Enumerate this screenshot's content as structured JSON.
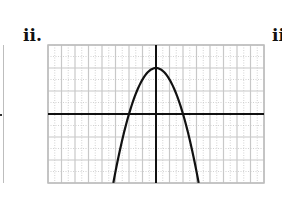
{
  "labels": {
    "main": "ii.",
    "next": "ii"
  },
  "colors": {
    "grid": "#c8c8c8",
    "axis": "#111111",
    "curve": "#111111",
    "frame": "#bcbcbc"
  },
  "chart_data": {
    "type": "line",
    "title": "ii.",
    "function": "y = 4 - x^2",
    "vertex": [
      0,
      4
    ],
    "x_intercepts": [
      -2,
      2
    ],
    "x": [
      -3.16,
      -3,
      -2.5,
      -2,
      -1.5,
      -1,
      -0.5,
      0,
      0.5,
      1,
      1.5,
      2,
      2.5,
      3,
      3.16
    ],
    "values": [
      -6,
      -5,
      -2.25,
      0,
      1.75,
      3,
      3.75,
      4,
      3.75,
      3,
      1.75,
      0,
      -2.25,
      -5,
      -6
    ],
    "xlim": [
      -8,
      8
    ],
    "ylim": [
      -6,
      6
    ],
    "xlabel": "",
    "ylabel": "",
    "grid": true,
    "tick_labels": false,
    "legend": null
  }
}
